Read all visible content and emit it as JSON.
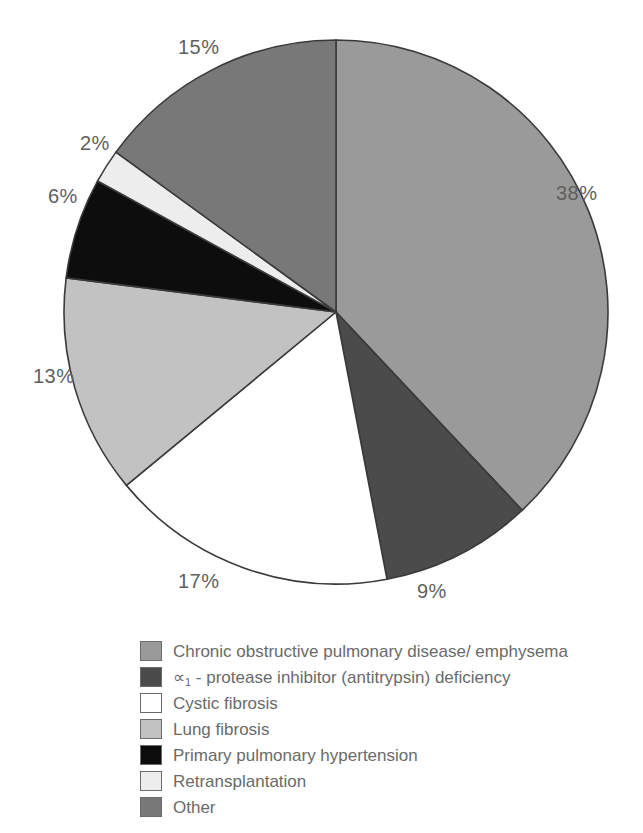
{
  "chart_data": {
    "type": "pie",
    "title": "",
    "subtitle": "",
    "xlabel": "",
    "ylabel": "",
    "legend_position": "bottom-left",
    "grid": false,
    "start_angle_deg": 0,
    "direction": "clockwise",
    "center": {
      "x": 336,
      "y": 312
    },
    "radius": 272,
    "categories": [
      "Chronic obstructive pulmonary disease/ emphysema",
      "∝1 - protease inhibitor (antitrypsin) deficiency",
      "Cystic fibrosis",
      "Lung fibrosis",
      "Primary pulmonary hypertension",
      "Retransplantation",
      "Other"
    ],
    "values": [
      38,
      9,
      17,
      13,
      6,
      2,
      15
    ],
    "value_labels": [
      "38%",
      "9%",
      "17%",
      "13%",
      "6%",
      "2%",
      "15%"
    ],
    "unit": "%",
    "colors": [
      "#9a9a9a",
      "#4b4b4b",
      "#ffffff",
      "#c2c2c2",
      "#0d0d0d",
      "#ededed",
      "#787878"
    ],
    "slice_outline_color": "#3a3a3a"
  },
  "slices": [
    {
      "name": "copd",
      "label": "Chronic obstructive pulmonary disease/ emphysema",
      "percent_label": "38%",
      "value": 38,
      "color": "#9a9a9a",
      "label_x": 556,
      "label_y": 182
    },
    {
      "name": "antitrypsin-deficiency",
      "label_pre": "∝",
      "label_sub": "1",
      "label_post": " - protease inhibitor (antitrypsin) deficiency",
      "percent_label": "9%",
      "value": 9,
      "color": "#4b4b4b",
      "label_x": 417,
      "label_y": 580
    },
    {
      "name": "cystic-fibrosis",
      "label": "Cystic fibrosis",
      "percent_label": "17%",
      "value": 17,
      "color": "#ffffff",
      "label_x": 178,
      "label_y": 570
    },
    {
      "name": "lung-fibrosis",
      "label": "Lung fibrosis",
      "percent_label": "13%",
      "value": 13,
      "color": "#c2c2c2",
      "label_x": 33,
      "label_y": 365
    },
    {
      "name": "primary-pulmonary-hypertension",
      "label": "Primary pulmonary hypertension",
      "percent_label": "6%",
      "value": 6,
      "color": "#0d0d0d",
      "label_x": 48,
      "label_y": 185
    },
    {
      "name": "retransplantation",
      "label": "Retransplantation",
      "percent_label": "2%",
      "value": 2,
      "color": "#ededed",
      "label_x": 80,
      "label_y": 132
    },
    {
      "name": "other",
      "label": "Other",
      "percent_label": "15%",
      "value": 15,
      "color": "#787878",
      "label_x": 178,
      "label_y": 36
    }
  ],
  "legend": {
    "items": [
      {
        "swatch_color": "#9a9a9a",
        "label": "Chronic obstructive pulmonary disease/ emphysema",
        "name": "copd"
      },
      {
        "swatch_color": "#4b4b4b",
        "label": "",
        "name": "antitrypsin-deficiency",
        "rich": true,
        "pre": "∝",
        "sub": "1",
        "post": " - protease inhibitor (antitrypsin) deficiency"
      },
      {
        "swatch_color": "#ffffff",
        "label": "Cystic fibrosis",
        "name": "cystic-fibrosis"
      },
      {
        "swatch_color": "#c2c2c2",
        "label": "Lung fibrosis",
        "name": "lung-fibrosis"
      },
      {
        "swatch_color": "#0d0d0d",
        "label": "Primary pulmonary hypertension",
        "name": "primary-pulmonary-hypertension"
      },
      {
        "swatch_color": "#ededed",
        "label": "Retransplantation",
        "name": "retransplantation"
      },
      {
        "swatch_color": "#787878",
        "label": "Other",
        "name": "other"
      }
    ]
  }
}
